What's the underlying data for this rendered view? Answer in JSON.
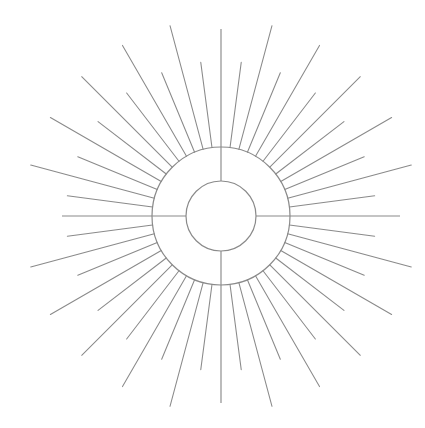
{
  "document": {
    "title": "Sunburst Emblem Line Drawing",
    "background_color": "#ffffff",
    "stroke_color": "#8a8a8a",
    "width": 425,
    "height": 428
  },
  "figure": {
    "name": "radiant-sunburst",
    "center": {
      "x": 221,
      "y": 216
    },
    "inner_circle": {
      "radius": 35,
      "stroke": "#8a8a8a",
      "fill": "none"
    },
    "outer_circle": {
      "radius": 69,
      "stroke": "#8a8a8a",
      "fill": "none"
    },
    "axes": {
      "vertical": {
        "top_y": 29,
        "bottom_y": 403,
        "x": 221
      },
      "horizontal": {
        "left_x": 62,
        "right_x": 400,
        "y": 216
      }
    },
    "rays": {
      "count": 48,
      "angular_step_degrees": 7.5,
      "start_radius": 69,
      "long_length": 128,
      "short_length": 86,
      "pattern": "alternating-long-short",
      "angles_degrees": [
        0,
        7.5,
        15,
        22.5,
        30,
        37.5,
        45,
        52.5,
        60,
        67.5,
        75,
        82.5,
        90,
        97.5,
        105,
        112.5,
        120,
        127.5,
        135,
        142.5,
        150,
        157.5,
        165,
        172.5,
        180,
        187.5,
        195,
        202.5,
        210,
        217.5,
        225,
        232.5,
        240,
        247.5,
        255,
        262.5,
        270,
        277.5,
        285,
        292.5,
        300,
        307.5,
        315,
        322.5,
        330,
        337.5,
        345,
        352.5
      ]
    }
  }
}
